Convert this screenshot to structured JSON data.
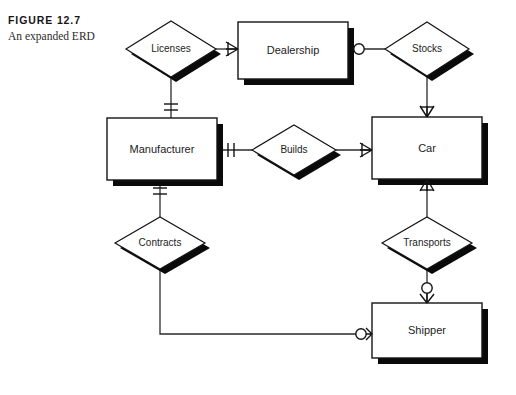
{
  "figure": {
    "number_label": "FIGURE 12.7",
    "caption": "An expanded ERD"
  },
  "diagram": {
    "type": "entity-relationship-diagram",
    "notation": "crows-foot",
    "entities": [
      {
        "id": "dealership",
        "label": "Dealership",
        "x": 238,
        "y": 22,
        "w": 110,
        "h": 57
      },
      {
        "id": "manufacturer",
        "label": "Manufacturer",
        "x": 107,
        "y": 118,
        "w": 110,
        "h": 62
      },
      {
        "id": "car",
        "label": "Car",
        "x": 372,
        "y": 117,
        "w": 110,
        "h": 62
      },
      {
        "id": "shipper",
        "label": "Shipper",
        "x": 372,
        "y": 303,
        "w": 110,
        "h": 55
      }
    ],
    "relationships": [
      {
        "id": "licenses",
        "label": "Licenses",
        "cx": 171,
        "cy": 49,
        "rx": 45,
        "ry": 28
      },
      {
        "id": "stocks",
        "label": "Stocks",
        "cx": 427,
        "cy": 49,
        "rx": 42,
        "ry": 27
      },
      {
        "id": "builds",
        "label": "Builds",
        "cx": 294,
        "cy": 150,
        "rx": 42,
        "ry": 25
      },
      {
        "id": "contracts",
        "label": "Contracts",
        "cx": 160,
        "cy": 243,
        "rx": 45,
        "ry": 26
      },
      {
        "id": "transports",
        "label": "Transports",
        "cx": 427,
        "cy": 243,
        "rx": 45,
        "ry": 26
      }
    ],
    "connections": [
      {
        "from": "licenses",
        "to": "dealership",
        "end_marker": "one-or-many"
      },
      {
        "from": "licenses",
        "to": "manufacturer",
        "end_marker": "one-and-only-one"
      },
      {
        "from": "dealership",
        "to": "stocks",
        "end_marker": "zero-or-one"
      },
      {
        "from": "stocks",
        "to": "car",
        "end_marker": "one-or-many"
      },
      {
        "from": "manufacturer",
        "to": "builds",
        "end_marker": "one-and-only-one"
      },
      {
        "from": "builds",
        "to": "car",
        "end_marker": "one-or-many"
      },
      {
        "from": "manufacturer",
        "to": "contracts",
        "end_marker": "one-and-only-one"
      },
      {
        "from": "car",
        "to": "transports",
        "end_marker": "one-or-many"
      },
      {
        "from": "transports",
        "to": "shipper",
        "end_marker": "zero-or-many"
      },
      {
        "from": "contracts",
        "to": "shipper",
        "end_marker": "zero-or-many"
      }
    ],
    "colors": {
      "line": "#2b2b2b",
      "shape_fill": "#ffffff",
      "shape_stroke": "#141414",
      "shadow": "#0a0a0a",
      "background": "#ffffff"
    }
  }
}
